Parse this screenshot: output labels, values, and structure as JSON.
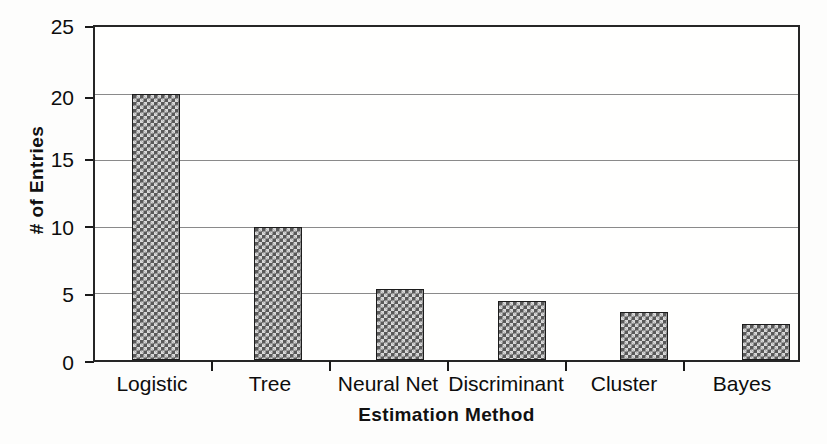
{
  "chart_data": {
    "type": "bar",
    "title": "",
    "xlabel": "Estimation Method",
    "ylabel": "# of Entries",
    "categories": [
      "Logistic",
      "Tree",
      "Neural Net",
      "Discriminant",
      "Cluster",
      "Bayes"
    ],
    "values": [
      20,
      10,
      5.3,
      4.4,
      3.6,
      2.7
    ],
    "ylim": [
      0,
      25
    ],
    "yticks": [
      0,
      5,
      10,
      15,
      20,
      25
    ],
    "ytick_labels": [
      "0",
      "5",
      "10",
      "15",
      "20",
      "25"
    ],
    "grid": true,
    "grid_axis": "y",
    "legend": false,
    "legend_position": "none",
    "bar_fill": "#595959",
    "bar_pattern": "checkerboard-hatch",
    "bar_edge_color": "#1c1c1c",
    "gridline_color": "#8a8a8a",
    "frame_color": "#262626",
    "background": "#fdfdfc"
  }
}
